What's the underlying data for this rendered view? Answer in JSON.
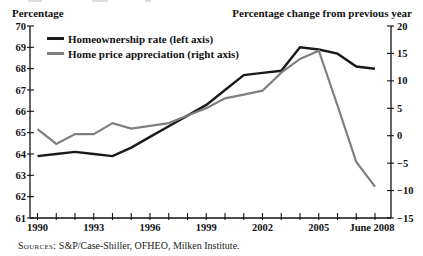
{
  "sources": {
    "prefix": "Sources:",
    "text": " S&P/Case-Shiller, OFHEO, Milken Institute."
  },
  "chart_data": {
    "type": "line",
    "title": "",
    "grid": false,
    "legend_position": "top-left",
    "x_categories": [
      "1990",
      "1991",
      "1992",
      "1993",
      "1994",
      "1995",
      "1996",
      "1997",
      "1998",
      "1999",
      "2000",
      "2001",
      "2002",
      "2003",
      "2004",
      "2005",
      "2006",
      "2007",
      "June 2008"
    ],
    "x_tick_labels": [
      {
        "index": 0,
        "label": "1990"
      },
      {
        "index": 3,
        "label": "1993"
      },
      {
        "index": 6,
        "label": "1996"
      },
      {
        "index": 9,
        "label": "1999"
      },
      {
        "index": 12,
        "label": "2002"
      },
      {
        "index": 15,
        "label": "2005"
      },
      {
        "index": 18,
        "label": "June 2008"
      }
    ],
    "left_axis": {
      "label": "Percentage",
      "min": 61,
      "max": 70,
      "step": 1,
      "tick_labels": [
        "70",
        "69",
        "68",
        "67",
        "66",
        "65",
        "64",
        "63",
        "62",
        "61"
      ]
    },
    "right_axis": {
      "label": "Percentage change from previous year",
      "min": -15,
      "max": 20,
      "step": 5,
      "tick_labels": [
        "20",
        "15",
        "10",
        "5",
        "0",
        "−5",
        "−10",
        "−15"
      ]
    },
    "series": [
      {
        "name": "Homeownership rate (left axis)",
        "axis": "left",
        "color": "#1a1a1a",
        "values": [
          63.9,
          64.0,
          64.1,
          64.0,
          63.9,
          64.3,
          64.8,
          65.3,
          65.8,
          66.3,
          67.0,
          67.7,
          67.8,
          67.9,
          69.0,
          68.9,
          68.7,
          68.1,
          68.0
        ]
      },
      {
        "name": "Home price appreciation (right axis)",
        "axis": "right",
        "color": "#7f7f7f",
        "values": [
          1.2,
          -1.5,
          0.3,
          0.3,
          2.3,
          1.3,
          1.8,
          2.3,
          3.7,
          5.0,
          6.8,
          7.5,
          8.2,
          11.5,
          14.0,
          15.5,
          5.5,
          -4.8,
          -9.3
        ]
      }
    ]
  }
}
